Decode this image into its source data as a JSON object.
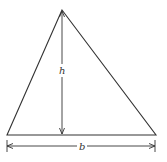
{
  "diagram": {
    "labels": {
      "height": "h",
      "base": "b"
    },
    "colors": {
      "stroke": "#333333",
      "background": "#ffffff"
    },
    "shape": {
      "type": "triangle",
      "vertices": [
        [
          62,
          10
        ],
        [
          7,
          135
        ],
        [
          156,
          135
        ]
      ]
    },
    "height_line": {
      "x": 62,
      "y1": 10,
      "y2": 135
    },
    "base_dimension": {
      "y": 146,
      "x1": 7,
      "x2": 156
    }
  }
}
